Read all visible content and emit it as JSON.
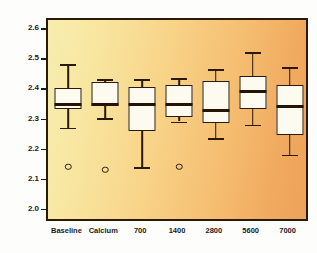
{
  "chart_data": {
    "type": "box",
    "title": "",
    "xlabel": "",
    "ylabel": "Serum calcium (mmol/l)",
    "ylim": [
      1.97,
      2.63
    ],
    "yticks": [
      "2.0",
      "2.1",
      "2.2",
      "2.3",
      "2.4",
      "2.5",
      "2.6"
    ],
    "ytick_values": [
      2.0,
      2.1,
      2.2,
      2.3,
      2.4,
      2.5,
      2.6
    ],
    "grid": false,
    "legend": "none",
    "categories": [
      "Baseline",
      "Calcium",
      "700",
      "1400",
      "2800",
      "5600",
      "7000"
    ],
    "boxes": [
      {
        "category": "Baseline",
        "whisker_low": 2.28,
        "q1": 2.34,
        "median": 2.355,
        "q3": 2.41,
        "whisker_high": 2.49,
        "outliers": [
          2.15
        ]
      },
      {
        "category": "Calcium",
        "whisker_low": 2.31,
        "q1": 2.35,
        "median": 2.355,
        "q3": 2.43,
        "whisker_high": 2.44,
        "outliers": [
          2.14
        ]
      },
      {
        "category": "700",
        "whisker_low": 2.15,
        "q1": 2.27,
        "median": 2.355,
        "q3": 2.415,
        "whisker_high": 2.44,
        "outliers": []
      },
      {
        "category": "1400",
        "whisker_low": 2.3,
        "q1": 2.315,
        "median": 2.355,
        "q3": 2.42,
        "whisker_high": 2.445,
        "outliers": [
          2.15
        ]
      },
      {
        "category": "2800",
        "whisker_low": 2.245,
        "q1": 2.295,
        "median": 2.335,
        "q3": 2.435,
        "whisker_high": 2.475,
        "outliers": []
      },
      {
        "category": "5600",
        "whisker_low": 2.29,
        "q1": 2.34,
        "median": 2.4,
        "q3": 2.45,
        "whisker_high": 2.53,
        "outliers": []
      },
      {
        "category": "7000",
        "whisker_low": 2.19,
        "q1": 2.255,
        "median": 2.35,
        "q3": 2.42,
        "whisker_high": 2.48,
        "outliers": []
      }
    ],
    "colors": {
      "box_fill": "#fdfaf0",
      "box_line": "#2b1a08",
      "plot_bg_left": "#f7edaf",
      "plot_bg_right": "#eda358",
      "text": "#1a1a1a"
    }
  }
}
